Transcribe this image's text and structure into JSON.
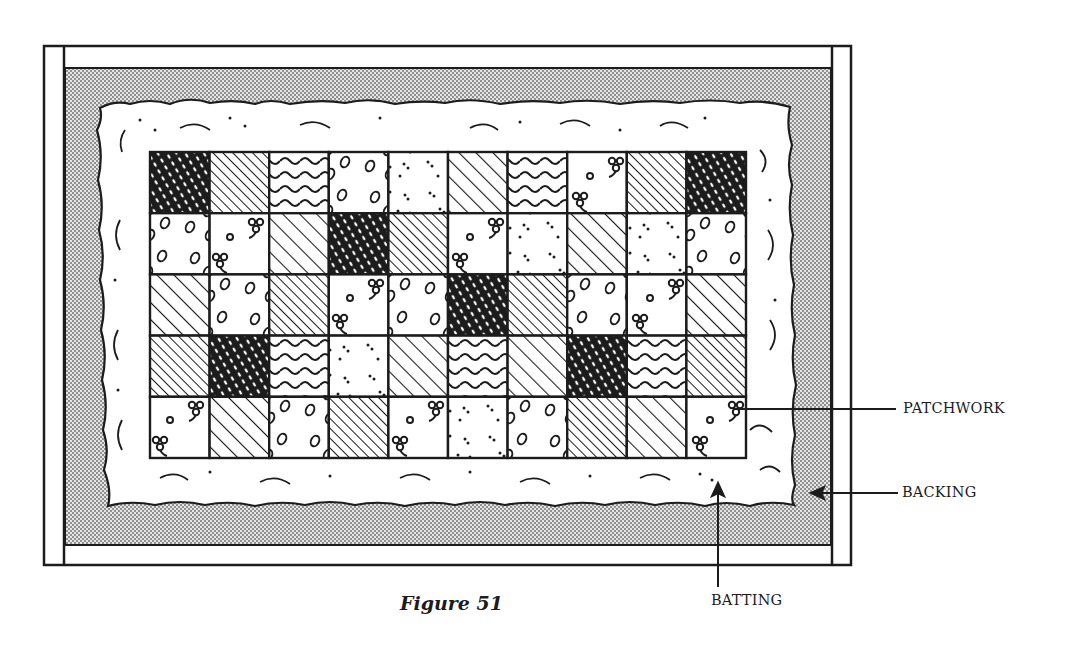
{
  "figure": {
    "caption": "Figure 51",
    "labels": {
      "patchwork": "PATCHWORK",
      "backing": "BACKING",
      "batting": "BATTING"
    }
  },
  "quilt": {
    "rows": 5,
    "cols": 10,
    "patterns": [
      [
        "dark",
        "hatch-fine",
        "wavy",
        "ovals",
        "dots",
        "hatch-wide",
        "wavy",
        "flowers",
        "hatch-fine",
        "dark"
      ],
      [
        "ovals",
        "flowers",
        "hatch-wide",
        "dark",
        "hatch-fine",
        "flowers",
        "dots",
        "hatch-wide",
        "dots",
        "ovals"
      ],
      [
        "hatch-wide",
        "ovals",
        "hatch-fine",
        "flowers",
        "ovals",
        "dark",
        "hatch-fine",
        "ovals",
        "flowers",
        "hatch-wide"
      ],
      [
        "hatch-fine",
        "dark",
        "wavy",
        "dots",
        "hatch-wide",
        "wavy",
        "hatch-wide",
        "dark",
        "wavy",
        "hatch-fine"
      ],
      [
        "flowers",
        "hatch-wide",
        "ovals",
        "hatch-fine",
        "flowers",
        "dots",
        "ovals",
        "hatch-fine",
        "hatch-wide",
        "flowers"
      ]
    ]
  },
  "colors": {
    "ink": "#1c1c1c",
    "paper": "#ffffff",
    "backing_fill": "#cfcfcf"
  }
}
